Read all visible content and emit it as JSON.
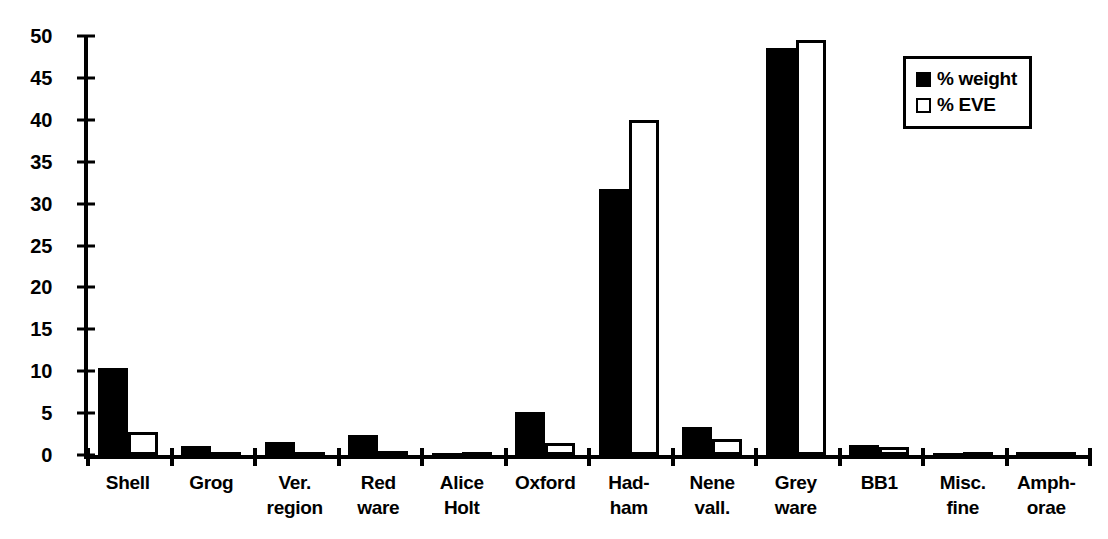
{
  "chart_data": {
    "type": "bar",
    "title": "",
    "xlabel": "",
    "ylabel": "",
    "ylim": [
      0,
      50
    ],
    "yticks": [
      0,
      5,
      10,
      15,
      20,
      25,
      30,
      35,
      40,
      45,
      50
    ],
    "grid": false,
    "legend_position": "top-right",
    "categories": [
      "Shell",
      "Grog",
      "Ver. region",
      "Red ware",
      "Alice Holt",
      "Oxford",
      "Had-ham",
      "Nene vall.",
      "Grey ware",
      "BB1",
      "Misc. fine",
      "Amph-orae"
    ],
    "category_lines": [
      [
        "Shell",
        ""
      ],
      [
        "Grog",
        ""
      ],
      [
        "Ver.",
        "region"
      ],
      [
        "Red",
        "ware"
      ],
      [
        "Alice",
        "Holt"
      ],
      [
        "Oxford",
        ""
      ],
      [
        "Had-",
        "ham"
      ],
      [
        "Nene",
        "vall."
      ],
      [
        "Grey",
        "ware"
      ],
      [
        "BB1",
        ""
      ],
      [
        "Misc.",
        "fine"
      ],
      [
        "Amph-",
        "orae"
      ]
    ],
    "series": [
      {
        "name": "% weight",
        "swatch": "filled",
        "values": [
          10.4,
          1.1,
          1.5,
          2.4,
          0.3,
          5.1,
          31.8,
          3.3,
          48.6,
          1.2,
          0.3,
          0.35
        ]
      },
      {
        "name": "% EVE",
        "swatch": "hollow",
        "values": [
          2.8,
          0.2,
          0.2,
          0.5,
          0.1,
          1.4,
          40.0,
          1.9,
          49.5,
          0.9,
          0.05,
          0.05
        ]
      }
    ],
    "colors": {
      "weight": "#000000",
      "eve": "#ffffff",
      "axis": "#000000",
      "background": "#ffffff"
    }
  }
}
